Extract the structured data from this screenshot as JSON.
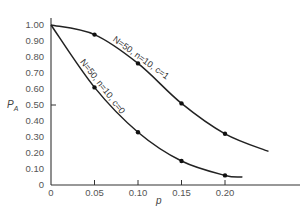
{
  "chart_data": {
    "type": "line",
    "title": "",
    "xlabel": "p",
    "ylabel": "P_A",
    "xlim": [
      0,
      0.28
    ],
    "ylim": [
      0,
      1.0
    ],
    "grid": false,
    "x_ticks": [
      "0",
      "0.05",
      "0.10",
      "0.15",
      "0.20"
    ],
    "y_ticks": [
      "1.00",
      "0.90",
      "0.80",
      "0.70",
      "0.60",
      "0.50",
      "0.40",
      "0.30",
      "0.20",
      "0.10",
      "0"
    ],
    "series": [
      {
        "name": "N = 50, n = 10, c = 1",
        "x": [
          0,
          0.05,
          0.1,
          0.15,
          0.2,
          0.25
        ],
        "values": [
          1.0,
          0.94,
          0.76,
          0.51,
          0.32,
          0.21
        ],
        "markers_at": [
          0.05,
          0.1,
          0.15,
          0.2
        ]
      },
      {
        "name": "N = 50, n = 10, c = 0",
        "x": [
          0,
          0.05,
          0.1,
          0.15,
          0.2,
          0.22
        ],
        "values": [
          1.0,
          0.61,
          0.33,
          0.15,
          0.06,
          0.05
        ],
        "markers_at": [
          0.05,
          0.1,
          0.15,
          0.2
        ]
      }
    ],
    "annotations": [
      "N = 50, n = 10, c = 1",
      "N = 50, n = 10, c = 0"
    ],
    "legend": "none (curves labeled inline)"
  },
  "labels": {
    "ylabel_main": "P",
    "ylabel_sub": "A",
    "xlabel": "p",
    "curve1": "N=50, n=10, c=1",
    "curve0": "N=50, n=10, c=0"
  }
}
